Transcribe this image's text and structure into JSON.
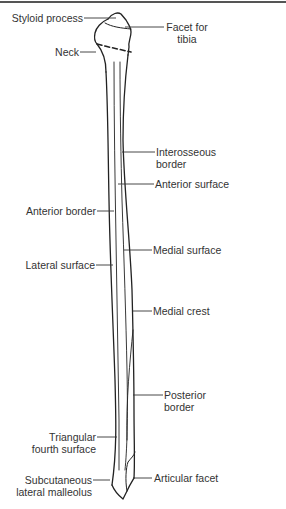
{
  "diagram": {
    "labels": {
      "styloid_process": "Styloid process",
      "facet_for_tibia_1": "Facet for",
      "facet_for_tibia_2": "tibia",
      "neck": "Neck",
      "interosseous_border_1": "Interosseous",
      "interosseous_border_2": "border",
      "anterior_surface": "Anterior surface",
      "anterior_border": "Anterior border",
      "medial_surface": "Medial surface",
      "lateral_surface": "Lateral surface",
      "medial_crest": "Medial crest",
      "posterior_border_1": "Posterior",
      "posterior_border_2": "border",
      "triangular_fourth_surface_1": "Triangular",
      "triangular_fourth_surface_2": "fourth surface",
      "subcutaneous_lateral_malleolus_1": "Subcutaneous",
      "subcutaneous_lateral_malleolus_2": "lateral malleolus",
      "articular_facet": "Articular facet"
    },
    "colors": {
      "line": "#222222",
      "text": "#333333",
      "background": "#ffffff"
    }
  }
}
